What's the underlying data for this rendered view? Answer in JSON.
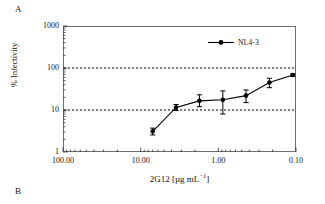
{
  "figure": {
    "panel_a_label": "A",
    "panel_b_label": "B"
  },
  "chart_data": {
    "type": "line",
    "title": "",
    "xlabel": "2G12 [µg mL−1]",
    "xlabel_base": "2G12 [µg mL",
    "xlabel_exponent": "−1",
    "xlabel_close": "]",
    "ylabel": "% Infectivity",
    "xscale": "log",
    "yscale": "log",
    "x_reversed": true,
    "xlim": [
      100.0,
      0.1
    ],
    "ylim": [
      1,
      1000
    ],
    "xticks": [
      100.0,
      10.0,
      1.0,
      0.1
    ],
    "xtick_labels": [
      "100.00",
      "10.00",
      "1.00",
      "0.10"
    ],
    "yticks": [
      1,
      10,
      100,
      1000
    ],
    "ytick_labels": [
      "1",
      "10",
      "100",
      "1000"
    ],
    "grid": "horizontal-dotted-at-10-and-100",
    "gridlines_y": [
      10,
      100
    ],
    "legend_position": "top-right",
    "marker": "filled-circle",
    "line_color": "#000000",
    "series": [
      {
        "name": "NL4-3",
        "x": [
          7.0,
          3.5,
          1.75,
          0.875,
          0.44,
          0.22,
          0.11
        ],
        "values": [
          3.1,
          11.5,
          16.5,
          17.5,
          22.0,
          45.0,
          68.0
        ],
        "err_low": [
          0.55,
          1.8,
          4.5,
          9.5,
          7.0,
          11.0,
          5.0
        ],
        "err_high": [
          0.6,
          2.0,
          6.5,
          11.0,
          8.0,
          12.0,
          5.0
        ]
      }
    ]
  }
}
